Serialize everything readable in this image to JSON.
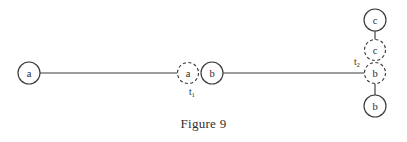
{
  "figure": {
    "caption": "Figure 9",
    "background_color": "#ffffff",
    "stroke_color": "#3a3a3a",
    "text_color": "#2b2b2b"
  },
  "diagram": {
    "type": "graph",
    "nodes": [
      {
        "id": "n1",
        "label": "a",
        "style": "solid",
        "cx": 29,
        "cy": 73,
        "r": 11
      },
      {
        "id": "n2",
        "label": "a",
        "style": "dashed",
        "cx": 188,
        "cy": 73,
        "r": 10.5
      },
      {
        "id": "n3",
        "label": "b",
        "style": "solid",
        "cx": 212,
        "cy": 73,
        "r": 11
      },
      {
        "id": "n4",
        "label": "c",
        "style": "solid",
        "cx": 375,
        "cy": 20,
        "r": 11
      },
      {
        "id": "n5",
        "label": "c",
        "style": "dashed",
        "cx": 375,
        "cy": 50,
        "r": 10.5
      },
      {
        "id": "n6",
        "label": "b",
        "style": "dashed",
        "cx": 375,
        "cy": 73,
        "r": 10.5
      },
      {
        "id": "n7",
        "label": "b",
        "style": "solid",
        "cx": 375,
        "cy": 106,
        "r": 11
      }
    ],
    "edges": [
      {
        "id": "e1",
        "from": "n1",
        "to": "n2",
        "x1": 40,
        "y1": 73,
        "x2": 177.5,
        "y2": 73
      },
      {
        "id": "e2",
        "from": "n3",
        "to": "n6",
        "x1": 223,
        "y1": 73,
        "x2": 364.5,
        "y2": 73
      },
      {
        "id": "e3",
        "from": "n4",
        "to": "n5",
        "x1": 375,
        "y1": 31,
        "x2": 375,
        "y2": 39.5
      },
      {
        "id": "e4",
        "from": "n7",
        "to": "n6",
        "x1": 375,
        "y1": 95,
        "x2": 375,
        "y2": 83.5
      }
    ],
    "time_labels": [
      {
        "id": "t1",
        "base": "t",
        "subscript": "1",
        "x": 192,
        "y": 94
      },
      {
        "id": "t2",
        "base": "t",
        "subscript": "2",
        "x": 358,
        "y": 64
      }
    ]
  }
}
